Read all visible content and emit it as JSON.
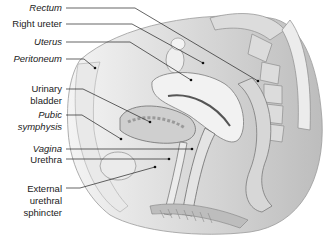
{
  "figure": {
    "labels": [
      {
        "id": "rectum",
        "text": "Rectum",
        "italic": true
      },
      {
        "id": "right-ureter",
        "text": "Right ureter",
        "italic": false
      },
      {
        "id": "uterus",
        "text": "Uterus",
        "italic": true
      },
      {
        "id": "peritoneum",
        "text": "Peritoneum",
        "italic": true
      },
      {
        "id": "urinary-bladder-1",
        "text": "Urinary",
        "italic": false
      },
      {
        "id": "urinary-bladder-2",
        "text": "bladder",
        "italic": false
      },
      {
        "id": "pubic-symphysis-1",
        "text": "Pubic",
        "italic": true
      },
      {
        "id": "pubic-symphysis-2",
        "text": "symphysis",
        "italic": true
      },
      {
        "id": "vagina",
        "text": "Vagina",
        "italic": true
      },
      {
        "id": "urethra",
        "text": "Urethra",
        "italic": false
      },
      {
        "id": "external-urethral-sphincter-1",
        "text": "External",
        "italic": false
      },
      {
        "id": "external-urethral-sphincter-2",
        "text": "urethral",
        "italic": false
      },
      {
        "id": "external-urethral-sphincter-3",
        "text": "sphincter",
        "italic": false
      }
    ]
  }
}
